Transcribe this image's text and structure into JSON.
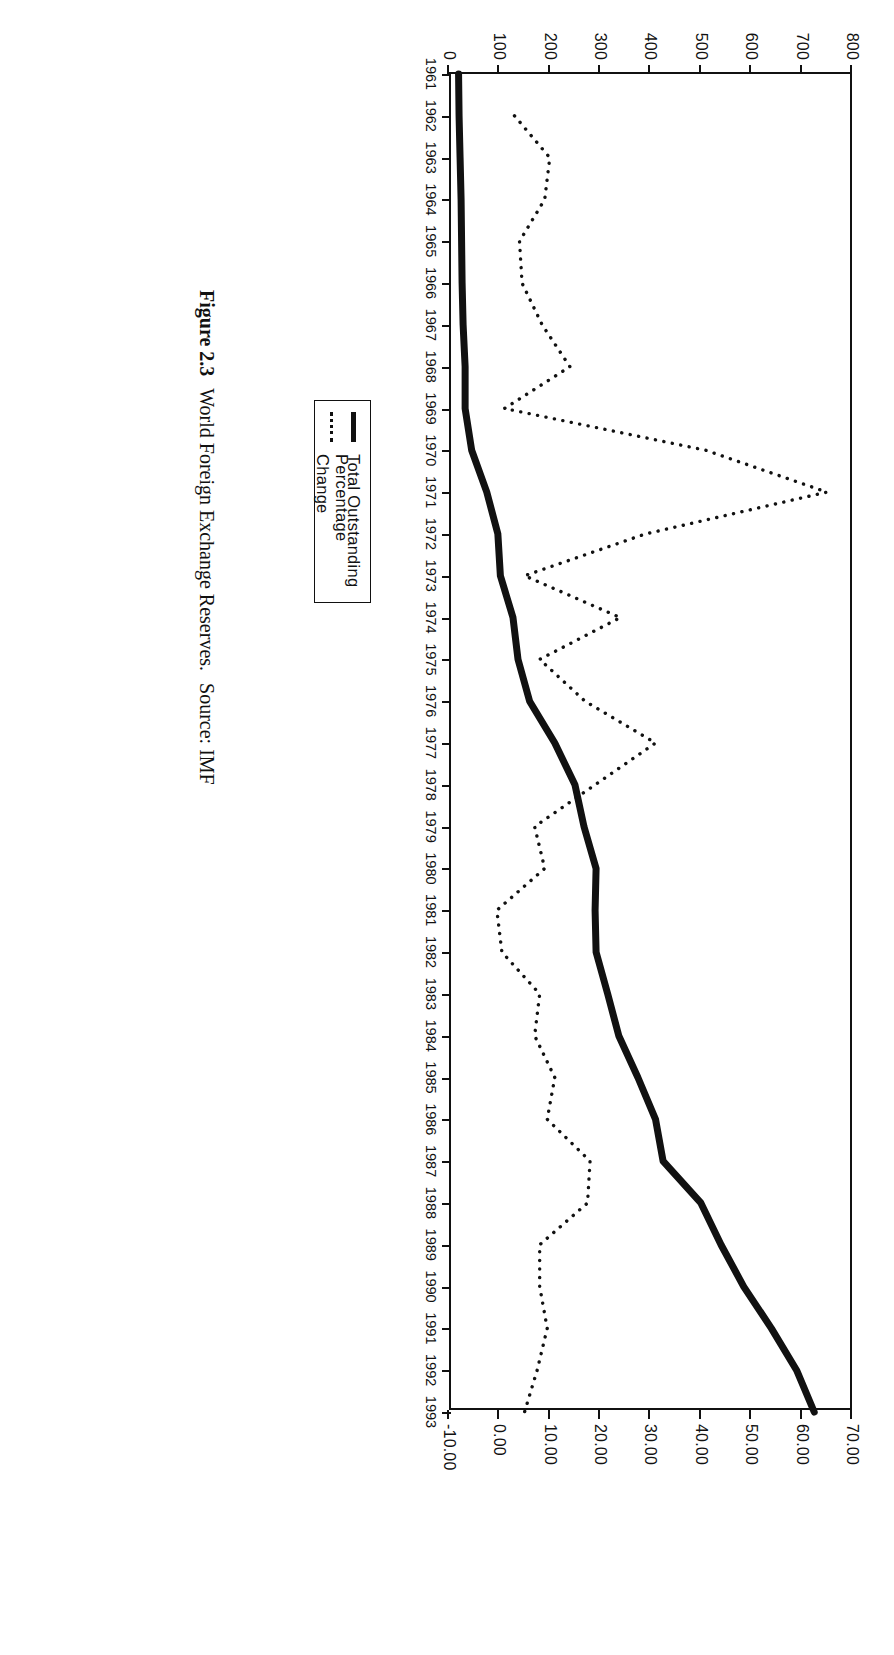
{
  "caption": {
    "figure_number": "Figure 2.3",
    "title": "World Foreign Exchange Reserves.",
    "source": "Source: IMF"
  },
  "legend": {
    "items": [
      {
        "label": "Total Outstanding",
        "style": "solid-thick",
        "key_icon": "solid-line-icon"
      },
      {
        "label": "Percentage Change",
        "style": "dotted",
        "key_icon": "dotted-line-icon"
      }
    ]
  },
  "chart_data": {
    "type": "line",
    "title": "World Foreign Exchange Reserves.",
    "subtitle": "",
    "xlabel": "",
    "ylabel": "",
    "grid": false,
    "legend_position": "top-right-inside",
    "x": [
      1961,
      1962,
      1963,
      1964,
      1965,
      1966,
      1967,
      1968,
      1969,
      1970,
      1971,
      1972,
      1973,
      1974,
      1975,
      1976,
      1977,
      1978,
      1979,
      1980,
      1981,
      1982,
      1983,
      1984,
      1985,
      1986,
      1987,
      1988,
      1989,
      1990,
      1991,
      1992,
      1993
    ],
    "categories": [
      "1961",
      "1962",
      "1963",
      "1964",
      "1965",
      "1966",
      "1967",
      "1968",
      "1969",
      "1970",
      "1971",
      "1972",
      "1973",
      "1974",
      "1975",
      "1976",
      "1977",
      "1978",
      "1979",
      "1980",
      "1981",
      "1982",
      "1983",
      "1984",
      "1985",
      "1986",
      "1987",
      "1988",
      "1989",
      "1990",
      "1991",
      "1992",
      "1993"
    ],
    "axes": {
      "left": {
        "name": "Total Outstanding",
        "ticks": [
          "0",
          "100",
          "200",
          "300",
          "400",
          "500",
          "600",
          "700",
          "800"
        ],
        "tick_values": [
          0,
          100,
          200,
          300,
          400,
          500,
          600,
          700,
          800
        ],
        "ylim": [
          0,
          800
        ]
      },
      "right": {
        "name": "Percentage Change",
        "ticks": [
          "-10.00",
          "0.00",
          "10.00",
          "20.00",
          "30.00",
          "40.00",
          "50.00",
          "60.00",
          "70.00"
        ],
        "tick_values": [
          -10,
          0,
          10,
          20,
          30,
          40,
          50,
          60,
          70
        ],
        "ylim": [
          -10,
          70
        ]
      }
    },
    "series": [
      {
        "name": "Total Outstanding",
        "axis": "left",
        "style": "solid-thick",
        "values": [
          19,
          20,
          22,
          24,
          25,
          26,
          28,
          32,
          32,
          45,
          75,
          97,
          102,
          127,
          137,
          160,
          210,
          250,
          268,
          292,
          290,
          292,
          315,
          337,
          375,
          410,
          425,
          500,
          540,
          585,
          640,
          690,
          725
        ]
      },
      {
        "name": "Percentage Change",
        "axis": "right",
        "style": "dotted",
        "values": [
          null,
          3.0,
          10.0,
          9.0,
          4.0,
          4.5,
          8.5,
          14.0,
          1.0,
          41.0,
          65.0,
          29.0,
          5.0,
          24.0,
          8.0,
          17.0,
          31.0,
          19.0,
          7.0,
          9.0,
          -0.5,
          0.5,
          8.0,
          7.0,
          11.0,
          9.5,
          18.0,
          17.5,
          8.0,
          8.0,
          9.5,
          7.5,
          5.0
        ]
      }
    ]
  }
}
